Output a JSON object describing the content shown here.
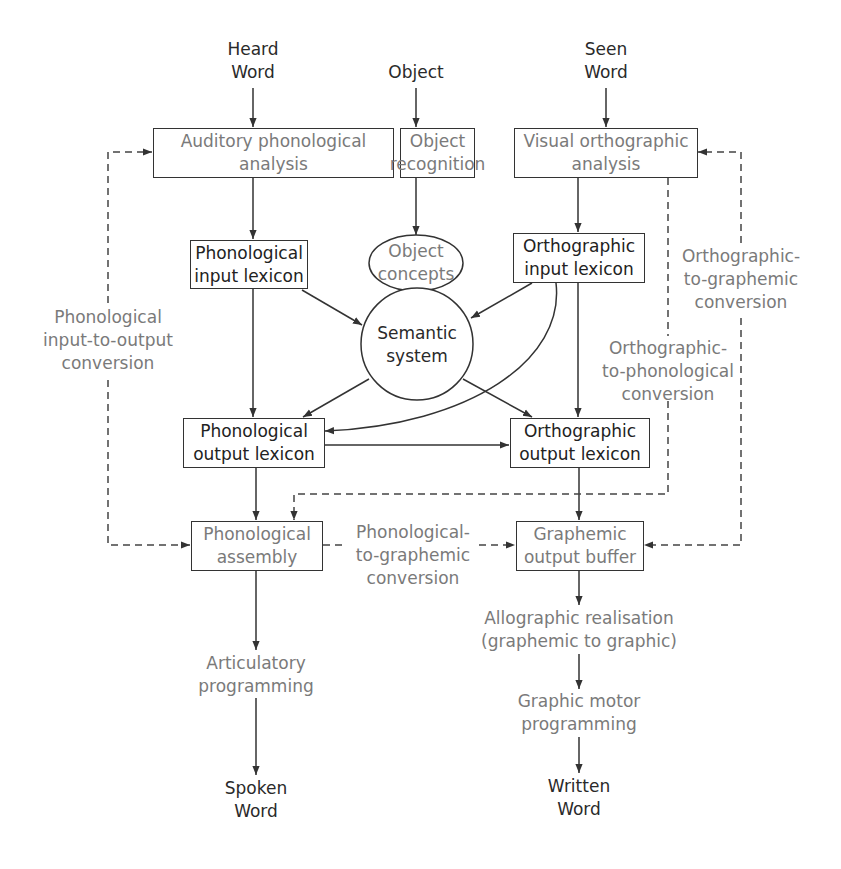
{
  "inputs": {
    "heard_word": "Heard\nWord",
    "object": "Object",
    "seen_word": "Seen\nWord"
  },
  "boxes": {
    "auditory_phonological_analysis": "Auditory phonological\nanalysis",
    "object_recognition": "Object\nrecognition",
    "visual_orthographic_analysis": "Visual orthographic\nanalysis",
    "phonological_input_lexicon": "Phonological\ninput lexicon",
    "orthographic_input_lexicon": "Orthographic\ninput lexicon",
    "phonological_output_lexicon": "Phonological\noutput lexicon",
    "orthographic_output_lexicon": "Orthographic\noutput lexicon",
    "phonological_assembly": "Phonological\nassembly",
    "graphemic_output_buffer": "Graphemic\noutput buffer"
  },
  "ovals": {
    "object_concepts": "Object\nconcepts",
    "semantic_system": "Semantic\nsystem"
  },
  "routes": {
    "phonological_input_to_output": "Phonological\ninput-to-output\nconversion",
    "orthographic_to_graphemic": "Orthographic-\nto-graphemic\nconversion",
    "orthographic_to_phonological": "Orthographic-\nto-phonological\nconversion",
    "phonological_to_graphemic": "Phonological-\nto-graphemic\nconversion"
  },
  "stages": {
    "articulatory_programming": "Articulatory\nprogramming",
    "allographic_realisation": "Allographic realisation\n(graphemic to graphic)",
    "graphic_motor_programming": "Graphic motor\nprogramming"
  },
  "outputs": {
    "spoken_word": "Spoken\nWord",
    "written_word": "Written\nWord"
  },
  "colors": {
    "line": "#333333",
    "dark_text": "#2a2a2a",
    "grey_text": "#7a7a7a",
    "background": "#ffffff"
  }
}
